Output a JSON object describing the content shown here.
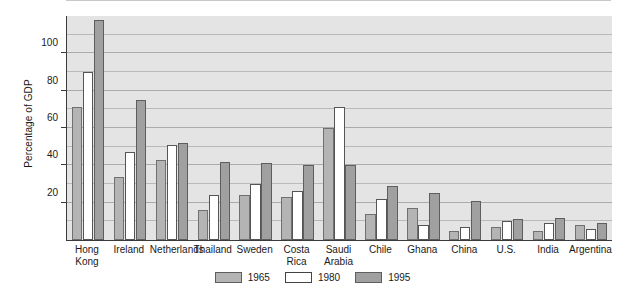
{
  "chart_data": {
    "type": "bar",
    "title": "",
    "subtitle": "",
    "xlabel": "",
    "ylabel": "Percentage of GDP",
    "ylim": [
      0,
      120
    ],
    "yticks": [
      20,
      40,
      60,
      80,
      100
    ],
    "ytick_labels": [
      "20",
      "40",
      "60",
      "80",
      "100"
    ],
    "grid": true,
    "grid_interval": 10,
    "legend_position": "bottom-center",
    "categories": [
      "Hong\nKong",
      "Ireland",
      "Netherlands",
      "Thailand",
      "Sweden",
      "Costa\nRica",
      "Saudi\nArabia",
      "Chile",
      "Ghana",
      "China",
      "U.S.",
      "India",
      "Argentina"
    ],
    "series": [
      {
        "name": "1965",
        "color": "#b4b4b4",
        "values": [
          71,
          34,
          43,
          16,
          24,
          23,
          60,
          14,
          17,
          5,
          7,
          5,
          8
        ]
      },
      {
        "name": "1980",
        "color": "#ffffff",
        "values": [
          90,
          47,
          51,
          24,
          30,
          26,
          71,
          22,
          8,
          7,
          10,
          9,
          6
        ]
      },
      {
        "name": "1995",
        "color": "#a0a0a0",
        "values": [
          118,
          75,
          52,
          42,
          41,
          40,
          40,
          29,
          25,
          21,
          11,
          12,
          9
        ]
      }
    ]
  },
  "legend": {
    "items": [
      {
        "label": "1965",
        "swatch": "y1965"
      },
      {
        "label": "1980",
        "swatch": "y1980"
      },
      {
        "label": "1995",
        "swatch": "y1995"
      }
    ]
  },
  "colors": {
    "plot_background": "#e4e4e4",
    "axis": "#3a3a3a",
    "gridline": "#b9b9b9"
  }
}
